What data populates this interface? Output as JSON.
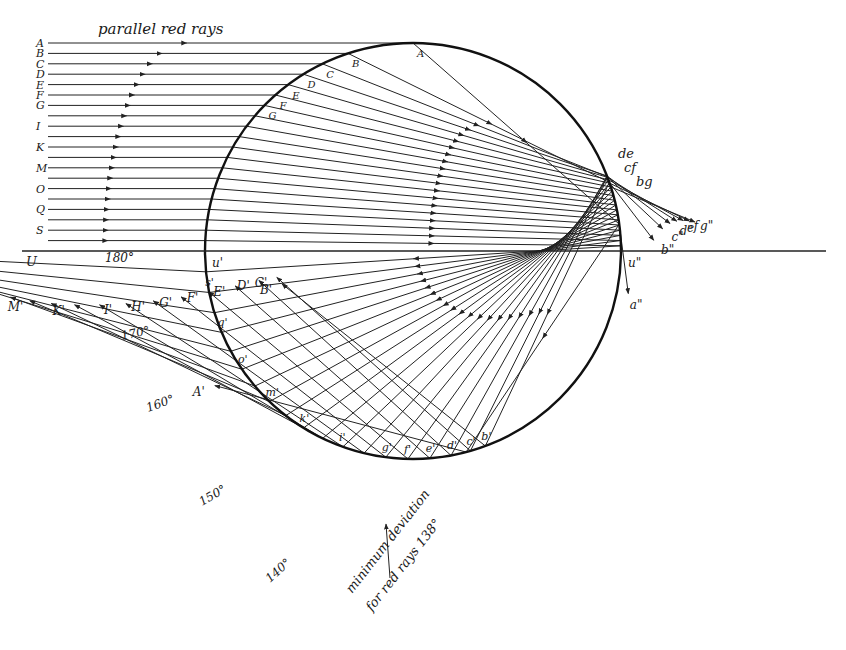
{
  "title": "parallel red rays",
  "colors": {
    "ink": "#222222",
    "background": "#ffffff"
  },
  "refractive_index_red": 1.331,
  "incoming_rays": [
    {
      "label": "A",
      "b": 1.0,
      "exit_label": "A'",
      "back_label": "",
      "secondary_label": "a\"",
      "surface_label": "A"
    },
    {
      "label": "B",
      "b": 0.95,
      "exit_label": "B'",
      "back_label": "b'",
      "secondary_label": "b\"",
      "surface_label": "B"
    },
    {
      "label": "C",
      "b": 0.9,
      "exit_label": "C'",
      "back_label": "c'",
      "secondary_label": "c\"",
      "surface_label": "C"
    },
    {
      "label": "D",
      "b": 0.85,
      "exit_label": "D'",
      "back_label": "d'",
      "secondary_label": "d\"",
      "surface_label": "D"
    },
    {
      "label": "E",
      "b": 0.8,
      "exit_label": "E'",
      "back_label": "e'",
      "secondary_label": "e",
      "surface_label": "E"
    },
    {
      "label": "F",
      "b": 0.75,
      "exit_label": "F'",
      "back_label": "f'",
      "secondary_label": "f",
      "surface_label": "F"
    },
    {
      "label": "G",
      "b": 0.7,
      "exit_label": "G'",
      "back_label": "g'",
      "secondary_label": "g\"",
      "surface_label": "G"
    },
    {
      "label": "",
      "b": 0.65,
      "exit_label": "H'",
      "back_label": "",
      "secondary_label": "",
      "surface_label": ""
    },
    {
      "label": "I",
      "b": 0.6,
      "exit_label": "I'",
      "back_label": "i'",
      "secondary_label": "",
      "surface_label": ""
    },
    {
      "label": "",
      "b": 0.55,
      "exit_label": "",
      "back_label": "",
      "secondary_label": "",
      "surface_label": ""
    },
    {
      "label": "K",
      "b": 0.5,
      "exit_label": "K'",
      "back_label": "k'",
      "secondary_label": "",
      "surface_label": ""
    },
    {
      "label": "",
      "b": 0.45,
      "exit_label": "",
      "back_label": "",
      "secondary_label": "",
      "surface_label": ""
    },
    {
      "label": "M",
      "b": 0.4,
      "exit_label": "M'",
      "back_label": "m'",
      "secondary_label": "",
      "surface_label": ""
    },
    {
      "label": "",
      "b": 0.35,
      "exit_label": "",
      "back_label": "",
      "secondary_label": "",
      "surface_label": ""
    },
    {
      "label": "O",
      "b": 0.3,
      "exit_label": "O'",
      "back_label": "o'",
      "secondary_label": "",
      "surface_label": ""
    },
    {
      "label": "",
      "b": 0.25,
      "exit_label": "",
      "back_label": "",
      "secondary_label": "",
      "surface_label": ""
    },
    {
      "label": "Q",
      "b": 0.2,
      "exit_label": "Q'",
      "back_label": "q'",
      "secondary_label": "",
      "surface_label": ""
    },
    {
      "label": "",
      "b": 0.15,
      "exit_label": "",
      "back_label": "",
      "secondary_label": "",
      "surface_label": ""
    },
    {
      "label": "S",
      "b": 0.1,
      "exit_label": "S'",
      "back_label": "s'",
      "secondary_label": "",
      "surface_label": ""
    },
    {
      "label": "",
      "b": 0.05,
      "exit_label": "",
      "back_label": "",
      "secondary_label": "",
      "surface_label": ""
    }
  ],
  "axis": {
    "left_label": "U",
    "entry_label": "u'",
    "exit_label": "u\""
  },
  "angle_marks": [
    "180°",
    "170°",
    "160°",
    "150°",
    "140°"
  ],
  "caustic_labels": [
    "de",
    "cf",
    "bg"
  ],
  "annotation": {
    "line1": "minimum deviation",
    "line2": "for red rays 138°"
  }
}
